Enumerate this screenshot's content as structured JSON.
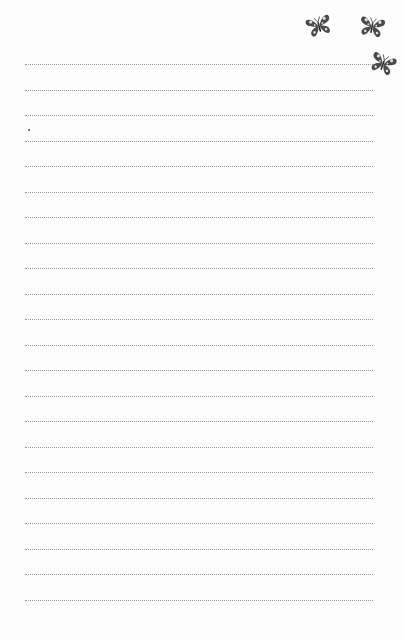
{
  "page": {
    "type": "lined-notepaper",
    "background_color": "#fdfdfd",
    "line_color": "#9a9a9a",
    "line_count": 22,
    "line_start_y": 64,
    "line_spacing": 25.5
  },
  "decorations": [
    {
      "icon": "butterfly-icon",
      "x": 306,
      "y": 13,
      "size": 26,
      "rotate": -15
    },
    {
      "icon": "butterfly-icon",
      "x": 359,
      "y": 14,
      "size": 26,
      "rotate": 10
    },
    {
      "icon": "butterfly-icon",
      "x": 370,
      "y": 51,
      "size": 26,
      "rotate": 20
    }
  ]
}
